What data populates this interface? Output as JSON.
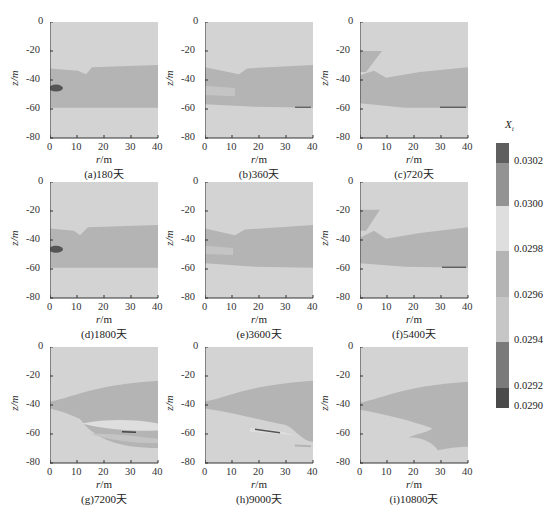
{
  "figure": {
    "colorbar": {
      "title": "X_i",
      "title_display": "Xi",
      "labels": [
        "0.0302",
        "0.0300",
        "0.0298",
        "0.0296",
        "0.0294",
        "0.0292",
        "0.0290"
      ],
      "bands": [
        {
          "range": "> 0.0302",
          "color": "#5f5f5f"
        },
        {
          "range": "0.0300-0.0302",
          "color": "#939393"
        },
        {
          "range": "0.0298-0.0300",
          "color": "#dedede"
        },
        {
          "range": "0.0296-0.0298",
          "color": "#b4b4b4"
        },
        {
          "range": "0.0294-0.0296",
          "color": "#c6c6c6"
        },
        {
          "range": "0.0292-0.0294",
          "color": "#7a7a7a"
        },
        {
          "range": "< 0.0292",
          "color": "#4a4a4a"
        }
      ]
    },
    "axes": {
      "xlabel": "r/m",
      "ylabel": "z/m",
      "xticks": [
        "0",
        "10",
        "20",
        "30",
        "40"
      ],
      "yticks": [
        "0",
        "-20",
        "-40",
        "-60",
        "-80"
      ]
    },
    "panels": [
      {
        "caption": "(a)180天"
      },
      {
        "caption": "(b)360天"
      },
      {
        "caption": "(c)720天"
      },
      {
        "caption": "(d)1800天"
      },
      {
        "caption": "(e)3600天"
      },
      {
        "caption": "(f)5400天"
      },
      {
        "caption": "(g)7200天"
      },
      {
        "caption": "(h)9000天"
      },
      {
        "caption": "(i)10800天"
      }
    ]
  },
  "chart_data": {
    "type": "heatmap",
    "title": "",
    "xlabel": "r/m",
    "ylabel": "z/m",
    "xlim": [
      0,
      40
    ],
    "ylim": [
      -80,
      0
    ],
    "colorbar_label": "X_i",
    "colorbar_ticks": [
      0.029,
      0.0292,
      0.0294,
      0.0296,
      0.0298,
      0.03,
      0.0302
    ],
    "subplots": [
      {
        "caption": "(a)180天",
        "time_days": 180,
        "description": "Darker band between z≈-32 and -60 m across r=0-40; notch near r≈8-10 m at z≈-35; dark spot near r≈0-3, z≈-46."
      },
      {
        "caption": "(b)360天",
        "time_days": 360,
        "description": "Band from z≈-32 to -58 m; notch at r≈10; light patch near r 0-10 z≈-45 to -52; thin dark streak near r≈35, z≈-59."
      },
      {
        "caption": "(c)720天",
        "time_days": 720,
        "description": "Wedge at r 0-8, z -20 to -35; band z≈-35 to -58; dark streak at r 30-40, z≈-59."
      },
      {
        "caption": "(d)1800天",
        "time_days": 1800,
        "description": "Similar to (a): band z≈-32 to -60, dark spot at r≈0-3, z≈-46."
      },
      {
        "caption": "(e)3600天",
        "time_days": 3600,
        "description": "Similar to (b)."
      },
      {
        "caption": "(f)5400天",
        "time_days": 5400,
        "description": "Similar to (c)."
      },
      {
        "caption": "(g)7200天",
        "time_days": 7200,
        "description": "Plume widening from r=0 z≈-40 to r=40 z -22..-70; layered light/dark lenses around z -50..-65, dark streak near r≈28, z≈-58."
      },
      {
        "caption": "(h)9000天",
        "time_days": 9000,
        "description": "Plume upper boundary r=0 z≈-38 to r=40 z≈-23; lower lobe to z≈-65 at r=40; dark streak r≈18-28, z≈-57."
      },
      {
        "caption": "(i)10800天",
        "time_days": 10800,
        "description": "Plume from r=0 z≈-40 rising to z≈-24 at r=40; lower tongue at r 18-40, z -60 to -72."
      }
    ]
  }
}
